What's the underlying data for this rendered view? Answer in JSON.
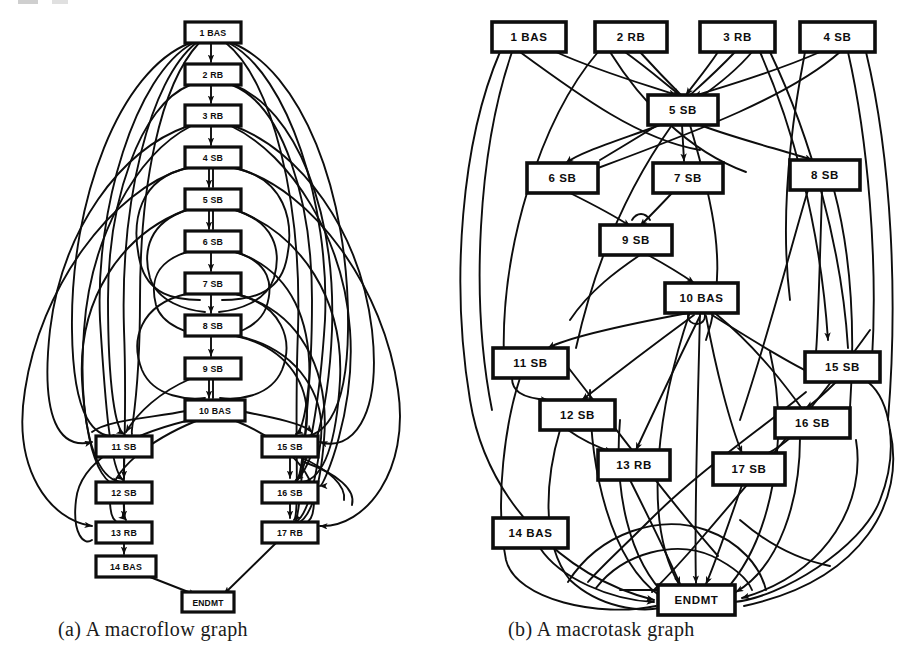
{
  "figure": {
    "background_color": "#ffffff",
    "ink_color": "#0d0d0d"
  },
  "captions": {
    "a": "(a)  A macroflow graph",
    "b": "(b)  A macrotask graph"
  },
  "chart_data": {
    "type": "diagram",
    "panels": [
      {
        "id": "a",
        "caption": "(a)  A macroflow graph",
        "node_count": 18,
        "nodes": [
          {
            "id": "1",
            "num": "1",
            "type": "BAS",
            "label": "1   BAS",
            "x": 185,
            "y": 22,
            "w": 56,
            "h": 21
          },
          {
            "id": "2",
            "num": "2",
            "type": "RB",
            "label": "2    RB",
            "x": 185,
            "y": 64,
            "w": 56,
            "h": 21
          },
          {
            "id": "3",
            "num": "3",
            "type": "RB",
            "label": "3    RB",
            "x": 185,
            "y": 105,
            "w": 56,
            "h": 21
          },
          {
            "id": "4",
            "num": "4",
            "type": "SB",
            "label": "4    SB",
            "x": 185,
            "y": 147,
            "w": 56,
            "h": 21
          },
          {
            "id": "5",
            "num": "5",
            "type": "SB",
            "label": "5    SB",
            "x": 185,
            "y": 189,
            "w": 56,
            "h": 21
          },
          {
            "id": "6",
            "num": "6",
            "type": "SB",
            "label": "6    SB",
            "x": 185,
            "y": 231,
            "w": 56,
            "h": 21
          },
          {
            "id": "7",
            "num": "7",
            "type": "SB",
            "label": "7    SB",
            "x": 185,
            "y": 273,
            "w": 56,
            "h": 21
          },
          {
            "id": "8",
            "num": "8",
            "type": "SB",
            "label": "8    SB",
            "x": 185,
            "y": 315,
            "w": 56,
            "h": 21
          },
          {
            "id": "9",
            "num": "9",
            "type": "SB",
            "label": "9    SB",
            "x": 185,
            "y": 358,
            "w": 56,
            "h": 21
          },
          {
            "id": "10",
            "num": "10",
            "type": "BAS",
            "label": "10  BAS",
            "x": 185,
            "y": 400,
            "w": 60,
            "h": 21
          },
          {
            "id": "11",
            "num": "11",
            "type": "SB",
            "label": "11   SB",
            "x": 96,
            "y": 436,
            "w": 56,
            "h": 21
          },
          {
            "id": "12",
            "num": "12",
            "type": "SB",
            "label": "12   SB",
            "x": 96,
            "y": 482,
            "w": 56,
            "h": 21
          },
          {
            "id": "13",
            "num": "13",
            "type": "RB",
            "label": "13   RB",
            "x": 96,
            "y": 522,
            "w": 56,
            "h": 21
          },
          {
            "id": "14",
            "num": "14",
            "type": "BAS",
            "label": "14  BAS",
            "x": 96,
            "y": 556,
            "w": 60,
            "h": 21
          },
          {
            "id": "15",
            "num": "15",
            "type": "SB",
            "label": "15   SB",
            "x": 262,
            "y": 436,
            "w": 56,
            "h": 21
          },
          {
            "id": "16",
            "num": "16",
            "type": "SB",
            "label": "16   SB",
            "x": 262,
            "y": 482,
            "w": 56,
            "h": 21
          },
          {
            "id": "17",
            "num": "17",
            "type": "RB",
            "label": "17   RB",
            "x": 262,
            "y": 522,
            "w": 56,
            "h": 21
          },
          {
            "id": "END",
            "num": "",
            "type": "ENDMT",
            "label": "ENDMT",
            "x": 182,
            "y": 592,
            "w": 52,
            "h": 20
          }
        ]
      },
      {
        "id": "b",
        "caption": "(b)  A macrotask graph",
        "node_count": 18,
        "nodes": [
          {
            "id": "1",
            "num": "1",
            "type": "BAS",
            "label": "1    BAS",
            "x": 492,
            "y": 22,
            "w": 74,
            "h": 30
          },
          {
            "id": "2",
            "num": "2",
            "type": "RB",
            "label": "2     RB",
            "x": 595,
            "y": 22,
            "w": 72,
            "h": 30
          },
          {
            "id": "3",
            "num": "3",
            "type": "RB",
            "label": "3     RB",
            "x": 700,
            "y": 22,
            "w": 75,
            "h": 30
          },
          {
            "id": "4",
            "num": "4",
            "type": "SB",
            "label": "4     SB",
            "x": 800,
            "y": 22,
            "w": 75,
            "h": 30
          },
          {
            "id": "5",
            "num": "5",
            "type": "SB",
            "label": "5     SB",
            "x": 648,
            "y": 95,
            "w": 70,
            "h": 30
          },
          {
            "id": "6",
            "num": "6",
            "type": "SB",
            "label": "6     SB",
            "x": 527,
            "y": 163,
            "w": 71,
            "h": 30
          },
          {
            "id": "7",
            "num": "7",
            "type": "SB",
            "label": "7     SB",
            "x": 653,
            "y": 163,
            "w": 70,
            "h": 30
          },
          {
            "id": "8",
            "num": "8",
            "type": "SB",
            "label": "8     SB",
            "x": 790,
            "y": 160,
            "w": 70,
            "h": 30
          },
          {
            "id": "9",
            "num": "9",
            "type": "SB",
            "label": "9     SB",
            "x": 600,
            "y": 225,
            "w": 72,
            "h": 30
          },
          {
            "id": "10",
            "num": "10",
            "type": "BAS",
            "label": "10   BAS",
            "x": 665,
            "y": 283,
            "w": 73,
            "h": 30
          },
          {
            "id": "11",
            "num": "11",
            "type": "SB",
            "label": "11    SB",
            "x": 493,
            "y": 348,
            "w": 75,
            "h": 30
          },
          {
            "id": "12",
            "num": "12",
            "type": "SB",
            "label": "12    SB",
            "x": 540,
            "y": 400,
            "w": 75,
            "h": 30
          },
          {
            "id": "13",
            "num": "13",
            "type": "RB",
            "label": "13    RB",
            "x": 598,
            "y": 450,
            "w": 72,
            "h": 30
          },
          {
            "id": "14",
            "num": "14",
            "type": "BAS",
            "label": "14   BAS",
            "x": 493,
            "y": 518,
            "w": 75,
            "h": 30
          },
          {
            "id": "15",
            "num": "15",
            "type": "SB",
            "label": "15    SB",
            "x": 805,
            "y": 352,
            "w": 75,
            "h": 30
          },
          {
            "id": "16",
            "num": "16",
            "type": "SB",
            "label": "16    SB",
            "x": 775,
            "y": 408,
            "w": 75,
            "h": 30
          },
          {
            "id": "17",
            "num": "17",
            "type": "SB",
            "label": "17    SB",
            "x": 713,
            "y": 453,
            "w": 72,
            "h": 32
          },
          {
            "id": "END",
            "num": "",
            "type": "ENDMT",
            "label": "ENDMT",
            "x": 658,
            "y": 585,
            "w": 77,
            "h": 30
          }
        ]
      }
    ]
  }
}
